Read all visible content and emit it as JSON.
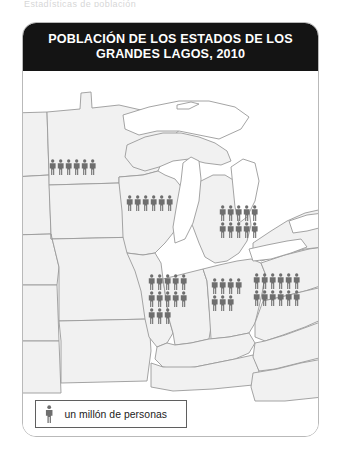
{
  "top_sliver_text": "Estadísticas de población",
  "figure": {
    "title_line1": "POBLACIÓN DE LOS ESTADOS DE LOS",
    "title_line2": "GRANDES LAGOS, 2010",
    "title_full": "POBLACIÓN DE LOS ESTADOS DE LOS GRANDES LAGOS, 2010",
    "title_background_color": "#141414",
    "title_text_color": "#ffffff",
    "card_border_color": "#b9b9b9",
    "card_background_color": "#ffffff"
  },
  "legend": {
    "label": "un millón de personas",
    "symbol": "person-icon",
    "symbol_value": 1,
    "symbol_unit": "millón de personas",
    "border_color": "#5f5f5f",
    "icon_color": "#6e6e6e"
  },
  "map": {
    "land_fill": "#f1f1f1",
    "border_stroke": "#9a9a9a",
    "water_fill": "#ffffff",
    "icon_color": "#6e6e6e"
  },
  "chart_data": {
    "type": "pictogram",
    "title": "POBLACIÓN DE LOS ESTADOS DE LOS GRANDES LAGOS, 2010",
    "subtitle": "",
    "xlabel": "",
    "ylabel": "",
    "unit": "millones de personas",
    "symbol_value": 1,
    "symbol_label": "un millón de personas",
    "legend_position": "bottom-left",
    "grid": false,
    "categories": [
      "Minnesota",
      "Wisconsin",
      "Michigan",
      "Illinois",
      "Indiana",
      "Ohio"
    ],
    "values": [
      5.3,
      5.7,
      9.9,
      12.8,
      6.5,
      11.5
    ],
    "icon_counts": [
      {
        "state": "Minnesota",
        "full_icons": 5,
        "partial_icons": 1,
        "total": 5.3,
        "rows": [
          6
        ]
      },
      {
        "state": "Wisconsin",
        "full_icons": 5,
        "partial_icons": 1,
        "total": 5.7,
        "rows": [
          6
        ]
      },
      {
        "state": "Michigan",
        "full_icons": 10,
        "partial_icons": 0,
        "total": 9.9,
        "rows": [
          5,
          5
        ]
      },
      {
        "state": "Illinois",
        "full_icons": 13,
        "partial_icons": 0,
        "total": 12.8,
        "rows": [
          5,
          5,
          3
        ]
      },
      {
        "state": "Indiana",
        "full_icons": 7,
        "partial_icons": 0,
        "total": 6.5,
        "rows": [
          4,
          3
        ]
      },
      {
        "state": "Ohio",
        "full_icons": 12,
        "partial_icons": 0,
        "total": 11.5,
        "rows": [
          6,
          6
        ]
      }
    ]
  },
  "clusters": {
    "minnesota": {
      "name": "Minnesota",
      "count": 6,
      "columns": 6,
      "left": 26,
      "top": 88
    },
    "wisconsin": {
      "name": "Wisconsin",
      "count": 6,
      "columns": 6,
      "left": 103,
      "top": 124
    },
    "michigan": {
      "name": "Michigan",
      "count": 10,
      "columns": 5,
      "left": 196,
      "top": 134
    },
    "illinois": {
      "name": "Illinois",
      "count": 13,
      "columns": 5,
      "left": 125,
      "top": 203
    },
    "indiana": {
      "name": "Indiana",
      "count": 7,
      "columns": 4,
      "left": 188,
      "top": 207
    },
    "ohio": {
      "name": "Ohio",
      "count": 12,
      "columns": 6,
      "left": 230,
      "top": 202
    }
  }
}
